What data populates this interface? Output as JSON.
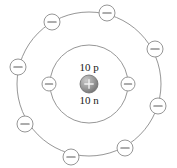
{
  "diagram": {
    "background_color": "#ffffff",
    "stroke_color": "#8a8a8a",
    "nucleus": {
      "protons_label": "10 p",
      "neutrons_label": "10 n",
      "charge_symbol": "+",
      "center_x": 89,
      "center_y": 84,
      "radius": 9,
      "fill_color": "#8c8c8c",
      "protons_label_x": 89,
      "protons_label_y": 68,
      "neutrons_label_x": 89,
      "neutrons_label_y": 101
    },
    "shells": [
      {
        "name": "inner-shell",
        "index": 1,
        "radius": 39,
        "electron_count": 2,
        "electron_symbol": "−",
        "electron_radius": 7,
        "electrons": [
          {
            "name": "electron-inner-left",
            "x": 49,
            "y": 84
          },
          {
            "name": "electron-inner-right",
            "x": 128,
            "y": 84
          }
        ]
      },
      {
        "name": "outer-shell",
        "index": 2,
        "radius": 72,
        "electron_count": 8,
        "electron_symbol": "−",
        "electron_radius": 8,
        "electrons": [
          {
            "name": "electron-outer-top",
            "x": 107,
            "y": 13
          },
          {
            "name": "electron-outer-upper-left",
            "x": 52,
            "y": 22
          },
          {
            "name": "electron-outer-left",
            "x": 18,
            "y": 67
          },
          {
            "name": "electron-outer-lower-left",
            "x": 25,
            "y": 124
          },
          {
            "name": "electron-outer-bottom",
            "x": 71,
            "y": 157
          },
          {
            "name": "electron-outer-lower-right",
            "x": 125,
            "y": 148
          },
          {
            "name": "electron-outer-right",
            "x": 158,
            "y": 106
          },
          {
            "name": "electron-outer-upper-right",
            "x": 155,
            "y": 49
          }
        ]
      }
    ]
  }
}
